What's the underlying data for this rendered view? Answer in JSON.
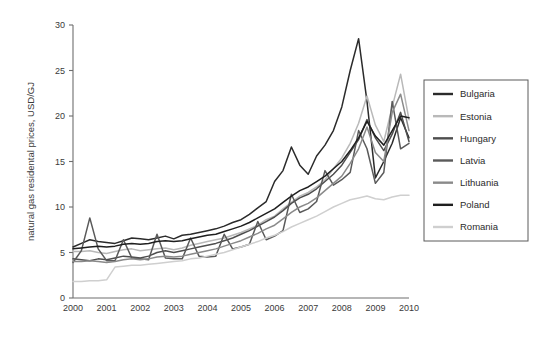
{
  "chart_data": {
    "type": "line",
    "title": "",
    "xlabel": "",
    "ylabel": "natural gas residental prices, USD/GJ",
    "xlim": [
      2000,
      2010
    ],
    "ylim": [
      0,
      30
    ],
    "ytick_labels": [
      "0",
      "5",
      "10",
      "15",
      "20",
      "25",
      "30"
    ],
    "ytick_values": [
      0,
      5,
      10,
      15,
      20,
      25,
      30
    ],
    "xtick_labels": [
      "2000",
      "2001",
      "2002",
      "2003",
      "2004",
      "2005",
      "2006",
      "2007",
      "2008",
      "2009",
      "2010"
    ],
    "xtick_values": [
      2000,
      2001,
      2002,
      2003,
      2004,
      2005,
      2006,
      2007,
      2008,
      2009,
      2010
    ],
    "grid": false,
    "legend_position": "right",
    "x": [
      2000,
      2000.25,
      2000.5,
      2000.75,
      2001,
      2001.25,
      2001.5,
      2001.75,
      2002,
      2002.25,
      2002.5,
      2002.75,
      2003,
      2003.25,
      2003.5,
      2003.75,
      2004,
      2004.25,
      2004.5,
      2004.75,
      2005,
      2005.25,
      2005.5,
      2005.75,
      2006,
      2006.25,
      2006.5,
      2006.75,
      2007,
      2007.25,
      2007.5,
      2007.75,
      2008,
      2008.25,
      2008.5,
      2008.75,
      2009,
      2009.25,
      2009.5,
      2009.75,
      2010
    ],
    "series": [
      {
        "name": "Bulgaria",
        "color": "#2b2b2b",
        "values": [
          5.6,
          6.0,
          6.4,
          6.2,
          6.1,
          6.0,
          6.3,
          6.6,
          6.5,
          6.4,
          6.6,
          6.8,
          6.5,
          6.9,
          7.0,
          7.2,
          7.4,
          7.6,
          7.9,
          8.3,
          8.6,
          9.2,
          9.9,
          10.6,
          12.8,
          14.0,
          16.6,
          14.6,
          13.6,
          15.6,
          16.8,
          18.4,
          21.0,
          25.0,
          28.5,
          21.6,
          13.2,
          15.0,
          17.0,
          19.8,
          17.6
        ]
      },
      {
        "name": "Estonia",
        "color": "#b9b9b9",
        "values": [
          5.1,
          5.1,
          5.2,
          5.0,
          4.9,
          5.1,
          5.3,
          5.4,
          5.2,
          5.3,
          5.4,
          5.5,
          5.3,
          5.5,
          5.8,
          6.0,
          6.2,
          6.4,
          6.6,
          6.9,
          7.2,
          7.6,
          8.0,
          8.6,
          9.0,
          9.8,
          10.5,
          11.2,
          11.6,
          12.2,
          13.0,
          14.2,
          15.4,
          17.0,
          19.2,
          22.2,
          19.0,
          17.2,
          21.0,
          24.6,
          19.6
        ]
      },
      {
        "name": "Hungary",
        "color": "#4e4e4e",
        "values": [
          4.3,
          4.2,
          4.1,
          4.3,
          4.2,
          4.4,
          4.6,
          4.5,
          4.4,
          4.6,
          5.0,
          5.2,
          5.0,
          5.2,
          5.4,
          5.6,
          5.8,
          6.0,
          6.3,
          6.6,
          7.0,
          7.4,
          7.9,
          8.4,
          8.9,
          9.6,
          10.4,
          11.0,
          11.4,
          12.0,
          12.8,
          13.6,
          14.6,
          16.0,
          17.4,
          19.6,
          17.6,
          16.2,
          18.0,
          20.4,
          17.2
        ]
      },
      {
        "name": "Latvia",
        "color": "#5a5a5a",
        "values": [
          3.9,
          5.2,
          8.8,
          5.4,
          4.1,
          4.1,
          6.4,
          4.4,
          4.3,
          4.2,
          7.0,
          4.4,
          4.3,
          4.3,
          6.6,
          4.6,
          4.5,
          4.6,
          7.0,
          5.4,
          5.6,
          5.9,
          8.4,
          6.4,
          6.8,
          7.4,
          11.4,
          9.4,
          9.8,
          10.6,
          14.0,
          12.4,
          13.0,
          13.8,
          18.4,
          16.4,
          12.6,
          13.8,
          21.6,
          16.4,
          17.0
        ]
      },
      {
        "name": "Lithuania",
        "color": "#8a8a8a",
        "values": [
          4.0,
          4.0,
          4.1,
          4.0,
          3.9,
          4.0,
          4.2,
          4.3,
          4.2,
          4.3,
          4.5,
          4.6,
          4.5,
          4.6,
          4.8,
          5.0,
          5.2,
          5.4,
          5.7,
          6.0,
          6.3,
          6.7,
          7.1,
          7.6,
          8.0,
          8.7,
          9.4,
          10.0,
          10.4,
          11.0,
          11.8,
          12.6,
          13.4,
          14.8,
          16.4,
          18.8,
          16.0,
          15.0,
          20.4,
          22.4,
          18.4
        ]
      },
      {
        "name": "Poland",
        "color": "#1f1f1f",
        "values": [
          5.4,
          5.5,
          5.6,
          5.7,
          5.6,
          5.7,
          5.9,
          6.0,
          5.9,
          6.0,
          6.2,
          6.3,
          6.2,
          6.3,
          6.5,
          6.7,
          6.9,
          7.0,
          7.3,
          7.6,
          7.9,
          8.3,
          8.8,
          9.3,
          9.8,
          10.5,
          11.2,
          11.8,
          12.2,
          12.8,
          13.4,
          14.2,
          15.0,
          16.2,
          17.6,
          19.4,
          17.8,
          16.8,
          18.4,
          20.0,
          19.8
        ]
      },
      {
        "name": "Romania",
        "color": "#cfcfcf",
        "values": [
          1.8,
          1.8,
          1.9,
          1.9,
          2.0,
          3.4,
          3.5,
          3.6,
          3.6,
          3.7,
          3.8,
          3.9,
          4.0,
          4.1,
          4.3,
          4.4,
          4.6,
          4.8,
          5.0,
          5.3,
          5.6,
          5.9,
          6.2,
          6.6,
          6.9,
          7.3,
          7.8,
          8.2,
          8.6,
          9.0,
          9.5,
          10.0,
          10.4,
          10.8,
          11.0,
          11.2,
          10.9,
          10.8,
          11.1,
          11.3,
          11.3
        ]
      }
    ]
  },
  "legend": {
    "items": [
      {
        "label": "Bulgaria"
      },
      {
        "label": "Estonia"
      },
      {
        "label": "Hungary"
      },
      {
        "label": "Latvia"
      },
      {
        "label": "Lithuania"
      },
      {
        "label": "Poland"
      },
      {
        "label": "Romania"
      }
    ]
  },
  "footer": {
    "fragment": ""
  }
}
